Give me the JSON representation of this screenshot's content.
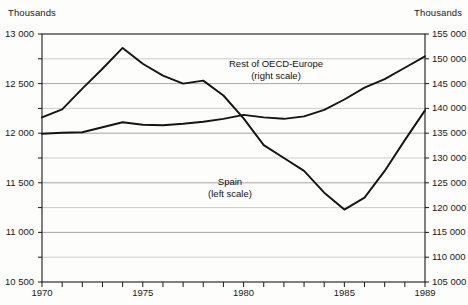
{
  "chart_data": {
    "type": "line",
    "title": "",
    "subtitle": "",
    "xlabel": "",
    "ylabel": "Thousands",
    "y2label": "Thousands",
    "x": [
      1970,
      1971,
      1972,
      1973,
      1974,
      1975,
      1976,
      1977,
      1978,
      1979,
      1980,
      1981,
      1982,
      1983,
      1984,
      1985,
      1986,
      1987,
      1988,
      1989
    ],
    "xlim": [
      1970,
      1989
    ],
    "xticks": [
      1970,
      1971,
      1972,
      1973,
      1974,
      1975,
      1976,
      1977,
      1978,
      1979,
      1980,
      1981,
      1982,
      1983,
      1984,
      1985,
      1986,
      1987,
      1988,
      1989
    ],
    "xtick_labels": [
      "1970",
      "1975",
      "1980",
      "1985",
      "1989"
    ],
    "xtick_label_values": [
      1970,
      1975,
      1980,
      1985,
      1989
    ],
    "ylim": [
      10500,
      13000
    ],
    "yticks": [
      10500,
      11000,
      11500,
      12000,
      12500,
      13000
    ],
    "ytick_labels": [
      "10 500",
      "11 000",
      "11 500",
      "12 000",
      "12 500",
      "13 000"
    ],
    "y_gridline_step": 250,
    "y2lim": [
      105000,
      155000
    ],
    "y2ticks": [
      105000,
      110000,
      115000,
      120000,
      125000,
      130000,
      135000,
      140000,
      145000,
      150000,
      155000
    ],
    "y2tick_labels": [
      "105 000",
      "110 000",
      "115 000",
      "120 000",
      "125 000",
      "130 000",
      "135 000",
      "140 000",
      "145 000",
      "150 000",
      "155 000"
    ],
    "grid": true,
    "legend_position": "inline-annotations",
    "series": [
      {
        "name": "Spain",
        "annotation": "Spain",
        "annotation_sub": "(left scale)",
        "axis": "left",
        "color": "#141414",
        "values": [
          12160,
          12240,
          12450,
          12650,
          12860,
          12700,
          12580,
          12500,
          12530,
          12380,
          12150,
          11880,
          11750,
          11620,
          11400,
          11230,
          11350,
          11620,
          11930,
          12230
        ]
      },
      {
        "name": "Rest of OECD-Europe",
        "annotation": "Rest of OECD-Europe",
        "annotation_sub": "(right scale)",
        "axis": "right",
        "color": "#141414",
        "values": [
          134900,
          135100,
          135200,
          136200,
          137200,
          136700,
          136600,
          136900,
          137300,
          137900,
          138700,
          138200,
          137900,
          138400,
          139700,
          141800,
          144200,
          145900,
          148200,
          150500
        ]
      }
    ]
  },
  "axes": {
    "left_unit": "Thousands",
    "right_unit": "Thousands"
  }
}
